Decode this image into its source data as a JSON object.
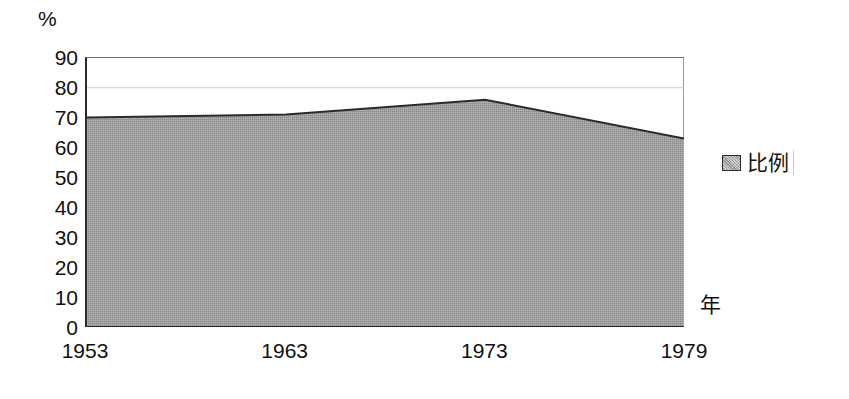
{
  "chart_data": {
    "type": "area",
    "title": "",
    "subtitle": "",
    "xlabel": "年",
    "ylabel": "%",
    "x": [
      1953,
      1963,
      1973,
      1979
    ],
    "categories": [
      "1953",
      "1963",
      "1973",
      "1979"
    ],
    "series": [
      {
        "name": "比例",
        "values": [
          70,
          71,
          76,
          63
        ],
        "fill_color": "#9e9e9e",
        "line_color": "#2b2b2b"
      }
    ],
    "ylim": [
      0,
      90
    ],
    "ytick_step": 10,
    "ytick_labels": [
      "90",
      "80",
      "70",
      "60",
      "50",
      "40",
      "30",
      "20",
      "10",
      "0"
    ],
    "ytick_values": [
      90,
      80,
      70,
      60,
      50,
      40,
      30,
      20,
      10,
      0
    ],
    "xtick_labels": [
      "1953",
      "1963",
      "1973",
      "1979"
    ],
    "grid": true,
    "gridlines_at": [
      80
    ],
    "legend_position": "right",
    "legend_entries": [
      "比例"
    ]
  },
  "axes": {
    "unit_label": "%",
    "x_title": "年"
  },
  "legend": {
    "items": [
      {
        "label": "比例",
        "color": "#9e9e9e"
      }
    ]
  },
  "colors": {
    "area_fill": "#9e9e9e",
    "area_line": "#2b2b2b",
    "axis": "#2b2b2b",
    "grid": "#c9c9c9",
    "background": "#ffffff",
    "text": "#111111"
  }
}
